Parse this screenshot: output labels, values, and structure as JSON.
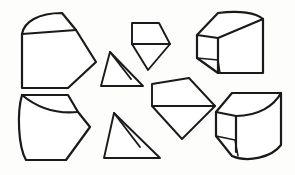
{
  "image": {
    "kind": "line-drawing",
    "title": "Geometric solids line drawing",
    "description": "Eight black outline line drawings of geometric solids and flat polygons arranged in two rows on a white background.",
    "width": 295,
    "height": 175,
    "background_color": "#fdfdfc",
    "stroke_color": "#1a1a1a"
  },
  "shapes": [
    {
      "id": "shape-1",
      "data_name": "shape-curved-top-wedge-top-left",
      "label": "Curved-top wedge solid",
      "position": "top-left",
      "stroke_width": 2.2,
      "outline": "M22,34 C24,22 38,13 62,13 L76,30 L96,62 L68,88 L22,88 Z",
      "interior_lines": [
        "M22,34 L76,30"
      ]
    },
    {
      "id": "shape-2",
      "data_name": "shape-divided-triangle-middle",
      "label": "Divided triangle wedge",
      "position": "center-left",
      "stroke_width": 2.0,
      "outline": "M110,52 L143,86 L101,86 Z",
      "interior_lines": [
        "M110,52 L131,79"
      ]
    },
    {
      "id": "shape-3",
      "data_name": "shape-pentagon-point-down-top-center",
      "label": "Pentagon with point down",
      "position": "top-center",
      "stroke_width": 2.0,
      "outline": "M132,23 L159,23 L170,44 L148,70 L132,44 Z",
      "interior_lines": [
        "M132,44 L170,44"
      ]
    },
    {
      "id": "shape-4",
      "data_name": "shape-cube-curved-top-right",
      "label": "Cube solid with curved top face",
      "position": "top-right",
      "stroke_width": 2.2,
      "outline": "M197,35 L218,13 C240,10 256,13 263,19 L263,73 L218,73 L197,58 Z",
      "interior_lines": [
        "M197,35 L218,38 L263,19",
        "M218,38 L218,73",
        "M197,58 L218,60 L220,73"
      ]
    },
    {
      "id": "shape-5",
      "data_name": "shape-curved-cylinder-wedge-bottom-left",
      "label": "Curved cylinder wedge solid",
      "position": "bottom-left",
      "stroke_width": 2.2,
      "outline": "M22,95 L68,95 L78,112 L90,127 L66,160 L26,160 C18,146 17,112 22,95 Z",
      "interior_lines": [
        "M22,95 C40,110 58,114 78,112"
      ]
    },
    {
      "id": "shape-6",
      "data_name": "shape-divided-triangle-bottom-center",
      "label": "Divided triangle wedge",
      "position": "bottom-center",
      "stroke_width": 2.0,
      "outline": "M114,113 L160,158 L104,158 Z",
      "interior_lines": [
        "M114,113 L140,147"
      ]
    },
    {
      "id": "shape-7",
      "data_name": "shape-pentagon-point-down-center-right",
      "label": "Large pentagon with point down",
      "position": "center-right",
      "stroke_width": 2.0,
      "outline": "M152,84 L189,78 L215,106 L182,139 L152,106 Z",
      "interior_lines": [
        "M152,106 L215,106"
      ]
    },
    {
      "id": "shape-8",
      "data_name": "shape-cylinder-cube-bottom-right",
      "label": "Cylinder-cube solid with curved faces",
      "position": "bottom-right",
      "stroke_width": 2.2,
      "outline": "M216,112 L232,93 L281,93 L281,145 C272,157 248,163 232,156 L216,136 Z",
      "interior_lines": [
        "M216,112 L236,116 C258,116 274,106 281,93",
        "M236,116 L236,152",
        "M216,136 L235,140 L238,156"
      ]
    }
  ]
}
